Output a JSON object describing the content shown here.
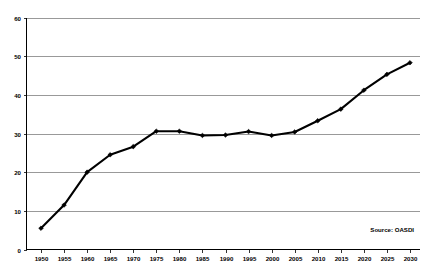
{
  "chart_data": {
    "type": "line",
    "title": "",
    "subtitle": "",
    "xlabel": "",
    "ylabel": "",
    "categories": [
      "1950",
      "1955",
      "1960",
      "1965",
      "1970",
      "1975",
      "1980",
      "1985",
      "1990",
      "1995",
      "2000",
      "2005",
      "2010",
      "2015",
      "2020",
      "2025",
      "2030"
    ],
    "x": [
      1950,
      1955,
      1960,
      1965,
      1970,
      1975,
      1980,
      1985,
      1990,
      1995,
      2000,
      2005,
      2010,
      2015,
      2020,
      2025,
      2030
    ],
    "values": [
      5.5,
      11.5,
      20.0,
      24.5,
      26.6,
      30.6,
      30.6,
      29.5,
      29.6,
      30.5,
      29.5,
      30.4,
      33.3,
      36.3,
      41.2,
      45.3,
      48.3
    ],
    "series": [
      {
        "name": "OASDI",
        "values": [
          5.5,
          11.5,
          20.0,
          24.5,
          26.6,
          30.6,
          30.6,
          29.5,
          29.6,
          30.5,
          29.5,
          30.4,
          33.3,
          36.3,
          41.2,
          45.3,
          48.3
        ]
      }
    ],
    "ylim": [
      0,
      60
    ],
    "yticks": [
      0,
      10,
      20,
      30,
      40,
      50,
      60
    ],
    "ytick_labels": [
      "0",
      "10",
      "20",
      "30",
      "40",
      "50",
      "60"
    ],
    "xtick_labels": [
      "1950",
      "1955",
      "1960",
      "1965",
      "1970",
      "1975",
      "1980",
      "1985",
      "1990",
      "1995",
      "2000",
      "2005",
      "2010",
      "2015",
      "2020",
      "2025",
      "2030"
    ],
    "grid": true,
    "grid_axis": "y",
    "legend": false,
    "legend_position": "none",
    "marker": "diamond",
    "line_color": "#000000",
    "grid_color": "#7f7f7f",
    "background_color": "#ffffff",
    "annotations": [
      {
        "name": "source-note",
        "text": "Source:  OASDI"
      }
    ]
  }
}
